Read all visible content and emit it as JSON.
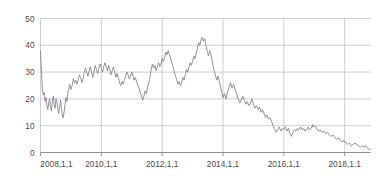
{
  "chart_data": {
    "type": "line",
    "title": "",
    "subtitle": "",
    "xlabel": "",
    "ylabel": "",
    "grid": true,
    "legend": false,
    "legend_position": "none",
    "line_color": "#7f7f8c",
    "grid_color": "#b9b9b9",
    "axis_color": "#8a8a8a",
    "x_axis": {
      "type": "date",
      "tick_labels": [
        "2008,1,1",
        "2010,1,1",
        "2012,1,1",
        "2014,1,1",
        "2016,1,1",
        "2018,1,1"
      ],
      "tick_values": [
        2008.0,
        2010.0,
        2012.0,
        2014.0,
        2016.0,
        2018.0
      ],
      "xlim": [
        2008.0,
        2018.85
      ]
    },
    "y_axis": {
      "tick_labels": [
        "0",
        "10",
        "20",
        "30",
        "40",
        "50"
      ],
      "tick_values": [
        0,
        10,
        20,
        30,
        40,
        50
      ],
      "ylim": [
        0,
        50
      ]
    },
    "series": [
      {
        "name": "value",
        "x": [
          2008.0,
          2008.03,
          2008.06,
          2008.09,
          2008.12,
          2008.15,
          2008.18,
          2008.21,
          2008.24,
          2008.27,
          2008.3,
          2008.33,
          2008.36,
          2008.39,
          2008.42,
          2008.45,
          2008.48,
          2008.51,
          2008.54,
          2008.57,
          2008.6,
          2008.63,
          2008.66,
          2008.69,
          2008.72,
          2008.75,
          2008.78,
          2008.81,
          2008.84,
          2008.87,
          2008.9,
          2008.93,
          2008.96,
          2009.0,
          2009.04,
          2009.08,
          2009.12,
          2009.16,
          2009.2,
          2009.24,
          2009.28,
          2009.32,
          2009.36,
          2009.4,
          2009.44,
          2009.48,
          2009.52,
          2009.56,
          2009.6,
          2009.64,
          2009.68,
          2009.72,
          2009.76,
          2009.8,
          2009.84,
          2009.88,
          2009.92,
          2009.96,
          2010.0,
          2010.04,
          2010.08,
          2010.12,
          2010.16,
          2010.2,
          2010.24,
          2010.28,
          2010.32,
          2010.36,
          2010.4,
          2010.44,
          2010.48,
          2010.52,
          2010.56,
          2010.6,
          2010.64,
          2010.68,
          2010.72,
          2010.76,
          2010.8,
          2010.84,
          2010.88,
          2010.92,
          2010.96,
          2011.0,
          2011.04,
          2011.08,
          2011.12,
          2011.16,
          2011.2,
          2011.24,
          2011.28,
          2011.32,
          2011.36,
          2011.4,
          2011.44,
          2011.48,
          2011.52,
          2011.56,
          2011.6,
          2011.64,
          2011.68,
          2011.72,
          2011.76,
          2011.8,
          2011.84,
          2011.88,
          2011.92,
          2011.96,
          2012.0,
          2012.04,
          2012.08,
          2012.12,
          2012.16,
          2012.2,
          2012.24,
          2012.28,
          2012.32,
          2012.36,
          2012.4,
          2012.44,
          2012.48,
          2012.52,
          2012.56,
          2012.6,
          2012.64,
          2012.68,
          2012.72,
          2012.76,
          2012.8,
          2012.84,
          2012.88,
          2012.92,
          2012.96,
          2013.0,
          2013.04,
          2013.08,
          2013.12,
          2013.16,
          2013.2,
          2013.24,
          2013.28,
          2013.32,
          2013.36,
          2013.4,
          2013.44,
          2013.48,
          2013.52,
          2013.56,
          2013.6,
          2013.64,
          2013.68,
          2013.72,
          2013.76,
          2013.8,
          2013.84,
          2013.88,
          2013.92,
          2013.96,
          2014.0,
          2014.05,
          2014.1,
          2014.15,
          2014.2,
          2014.25,
          2014.3,
          2014.35,
          2014.4,
          2014.45,
          2014.5,
          2014.55,
          2014.6,
          2014.65,
          2014.7,
          2014.75,
          2014.8,
          2014.85,
          2014.9,
          2014.95,
          2015.0,
          2015.05,
          2015.1,
          2015.15,
          2015.2,
          2015.25,
          2015.3,
          2015.35,
          2015.4,
          2015.45,
          2015.5,
          2015.55,
          2015.6,
          2015.65,
          2015.7,
          2015.75,
          2015.8,
          2015.85,
          2015.9,
          2015.95,
          2016.0,
          2016.05,
          2016.1,
          2016.15,
          2016.2,
          2016.25,
          2016.3,
          2016.35,
          2016.4,
          2016.45,
          2016.5,
          2016.55,
          2016.6,
          2016.65,
          2016.7,
          2016.75,
          2016.8,
          2016.85,
          2016.9,
          2016.95,
          2017.0,
          2017.06,
          2017.12,
          2017.18,
          2017.24,
          2017.3,
          2017.36,
          2017.42,
          2017.48,
          2017.54,
          2017.6,
          2017.66,
          2017.72,
          2017.78,
          2017.84,
          2017.9,
          2017.96,
          2018.02,
          2018.08,
          2018.14,
          2018.2,
          2018.26,
          2018.32,
          2018.38,
          2018.44,
          2018.5,
          2018.56,
          2018.62,
          2018.68,
          2018.74,
          2018.8,
          2018.85
        ],
        "values": [
          38.0,
          30.5,
          24.0,
          21.5,
          22.5,
          19.0,
          20.5,
          17.5,
          16.0,
          18.5,
          20.0,
          17.0,
          15.5,
          19.5,
          21.0,
          18.0,
          16.5,
          20.0,
          19.0,
          16.0,
          14.5,
          17.0,
          19.5,
          16.5,
          13.5,
          13.0,
          15.5,
          18.0,
          20.5,
          19.0,
          22.0,
          24.0,
          25.5,
          23.5,
          25.0,
          27.5,
          26.0,
          27.0,
          25.5,
          27.0,
          29.0,
          28.0,
          26.0,
          27.5,
          30.0,
          31.5,
          30.0,
          28.5,
          30.5,
          32.0,
          30.0,
          28.0,
          30.0,
          32.5,
          31.0,
          29.5,
          31.5,
          33.0,
          31.5,
          30.0,
          32.0,
          33.5,
          32.0,
          30.5,
          32.5,
          31.0,
          29.0,
          30.5,
          32.0,
          30.0,
          28.0,
          29.5,
          28.0,
          26.0,
          25.0,
          26.5,
          25.5,
          27.0,
          28.5,
          30.0,
          29.0,
          27.5,
          28.5,
          30.0,
          28.5,
          27.0,
          28.0,
          26.5,
          25.0,
          24.0,
          22.5,
          21.0,
          19.5,
          21.0,
          23.0,
          22.0,
          24.5,
          26.0,
          28.0,
          31.0,
          33.0,
          31.5,
          32.5,
          30.5,
          32.0,
          33.5,
          32.0,
          33.0,
          35.0,
          34.0,
          35.5,
          37.5,
          36.5,
          38.0,
          36.5,
          35.0,
          33.5,
          32.0,
          30.0,
          28.5,
          27.0,
          25.5,
          26.5,
          25.0,
          26.0,
          28.0,
          27.0,
          29.0,
          31.0,
          30.0,
          32.0,
          33.5,
          32.5,
          34.0,
          36.0,
          35.0,
          37.0,
          39.0,
          41.0,
          40.0,
          42.0,
          43.0,
          41.5,
          42.5,
          40.0,
          38.0,
          36.0,
          38.0,
          36.5,
          34.5,
          32.0,
          30.0,
          28.5,
          27.0,
          28.5,
          26.5,
          24.5,
          22.5,
          20.5,
          22.0,
          20.0,
          22.5,
          24.5,
          26.0,
          24.0,
          25.5,
          23.5,
          22.0,
          20.0,
          18.5,
          19.5,
          21.0,
          19.5,
          18.0,
          19.0,
          17.5,
          18.5,
          20.0,
          18.0,
          16.5,
          17.5,
          16.0,
          17.0,
          15.0,
          16.0,
          14.5,
          13.0,
          14.0,
          12.5,
          13.0,
          11.5,
          10.0,
          8.5,
          7.5,
          8.5,
          9.5,
          8.0,
          9.0,
          8.5,
          9.5,
          8.0,
          9.0,
          7.0,
          6.0,
          7.5,
          8.5,
          8.0,
          9.0,
          8.5,
          9.5,
          8.5,
          9.0,
          8.0,
          8.5,
          9.5,
          8.5,
          9.0,
          10.5,
          9.5,
          8.5,
          8.0,
          8.5,
          7.5,
          8.0,
          8.5,
          7.5,
          8.5,
          8.0,
          8.5,
          9.0,
          8.0,
          8.5,
          8.0,
          8.5,
          9.0,
          8.5,
          9.0,
          8.5,
          9.0,
          8.0,
          7.5,
          7.0,
          6.5,
          7.5,
          6.5,
          7.0,
          8.5,
          10.0,
          11.0,
          9.5
        ]
      }
    ],
    "annotations": []
  },
  "chart_tail": {
    "x": [
      2016.95,
      2017.02,
      2017.08,
      2017.14,
      2017.2,
      2017.26,
      2017.32,
      2017.38,
      2017.44,
      2017.5,
      2017.56,
      2017.62,
      2017.68,
      2017.74,
      2017.8,
      2017.86,
      2017.92,
      2017.98,
      2018.04,
      2018.1,
      2018.16,
      2018.22,
      2018.28,
      2018.34,
      2018.4,
      2018.46,
      2018.52,
      2018.58,
      2018.64,
      2018.7,
      2018.76,
      2018.82,
      2018.85
    ],
    "values": [
      9.5,
      10.0,
      9.0,
      8.0,
      8.5,
      7.5,
      8.0,
      7.0,
      7.5,
      6.5,
      6.0,
      6.5,
      5.5,
      5.0,
      5.5,
      4.5,
      4.0,
      4.5,
      3.5,
      3.0,
      3.5,
      2.5,
      3.0,
      3.5,
      3.0,
      2.5,
      2.0,
      2.5,
      2.0,
      2.5,
      1.5,
      1.2,
      1.0
    ]
  }
}
